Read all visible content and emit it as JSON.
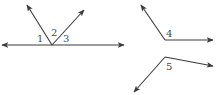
{
  "diagram": {
    "type": "angle-figures",
    "colors": {
      "line": "#3a3a3a",
      "label": "#4a4a4a",
      "background": "#ffffff"
    },
    "figures": [
      {
        "id": "figure-a",
        "description": "Horizontal line with two rays from a common vertex forming angles 1, 2, 3",
        "vertex": [
          52,
          45
        ],
        "rays": [
          {
            "to": [
              2,
              45
            ]
          },
          {
            "to": [
              124,
              45
            ]
          },
          {
            "to": [
              27,
              5
            ]
          },
          {
            "to": [
              84,
              10
            ]
          }
        ],
        "labels": [
          {
            "text": "1",
            "pos": [
              37,
              42
            ]
          },
          {
            "text": "2",
            "pos": [
              51,
              36
            ]
          },
          {
            "text": "3",
            "pos": [
              63,
              42
            ]
          }
        ]
      },
      {
        "id": "figure-b",
        "description": "Angle 4 formed by two rays",
        "vertex": [
          165,
          40
        ],
        "rays": [
          {
            "to": [
              141,
              5
            ]
          },
          {
            "to": [
              213,
              40
            ]
          }
        ],
        "labels": [
          {
            "text": "4",
            "pos": [
              166,
              37
            ]
          }
        ]
      },
      {
        "id": "figure-c",
        "description": "Angle 5 formed by two rays",
        "vertex": [
          165,
          57
        ],
        "rays": [
          {
            "to": [
              213,
              66
            ]
          },
          {
            "to": [
              134,
              92
            ]
          }
        ],
        "labels": [
          {
            "text": "5",
            "pos": [
              166,
              70
            ]
          }
        ]
      }
    ]
  }
}
